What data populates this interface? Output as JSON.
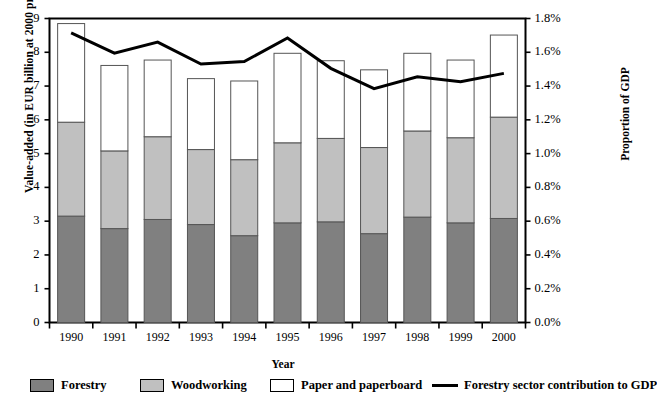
{
  "chart_data": {
    "type": "bar",
    "title": "",
    "subtitle": "",
    "xlabel": "Year",
    "ylabel": "Value-added (in EUR billion at 2000 prices)",
    "y2label": "Proportion of GDP",
    "categories": [
      "1990",
      "1991",
      "1992",
      "1993",
      "1994",
      "1995",
      "1996",
      "1997",
      "1998",
      "1999",
      "2000"
    ],
    "ylim": [
      0,
      9
    ],
    "yticks": [
      "0",
      "1",
      "2",
      "3",
      "4",
      "5",
      "6",
      "7",
      "8",
      "9"
    ],
    "y2lim": [
      0,
      1.8
    ],
    "y2ticks": [
      "0.0%",
      "0.2%",
      "0.4%",
      "0.6%",
      "0.8%",
      "1.0%",
      "1.2%",
      "1.4%",
      "1.6%",
      "1.8%"
    ],
    "grid": false,
    "stacked": true,
    "legend_position": "bottom",
    "series": [
      {
        "name": "Forestry",
        "type": "bar",
        "color": "#808080",
        "values": [
          3.15,
          2.78,
          3.05,
          2.9,
          2.57,
          2.95,
          2.98,
          2.63,
          3.12,
          2.95,
          3.08
        ]
      },
      {
        "name": "Woodworking",
        "type": "bar",
        "color": "#c0c0c0",
        "values": [
          2.78,
          2.3,
          2.45,
          2.22,
          2.25,
          2.37,
          2.47,
          2.55,
          2.55,
          2.52,
          3.0
        ]
      },
      {
        "name": "Paper and paperboard",
        "type": "bar",
        "color": "#ffffff",
        "values": [
          2.92,
          2.53,
          2.27,
          2.1,
          2.33,
          2.65,
          2.3,
          2.3,
          2.3,
          2.3,
          2.43
        ]
      },
      {
        "name": "Forestry sector contribution to GDP",
        "type": "line",
        "axis": "right",
        "color": "#000000",
        "values": [
          1.715,
          1.595,
          1.66,
          1.53,
          1.545,
          1.685,
          1.505,
          1.385,
          1.455,
          1.425,
          1.475
        ]
      }
    ],
    "totals": [
      8.85,
      7.61,
      7.77,
      7.22,
      7.15,
      7.97,
      7.75,
      7.48,
      7.97,
      7.77,
      8.51
    ]
  },
  "legend": {
    "items": [
      {
        "label": "Forestry",
        "marker": "swatch-dark",
        "x": 30
      },
      {
        "label": "Woodworking",
        "marker": "swatch-light",
        "x": 140
      },
      {
        "label": "Paper and paperboard",
        "marker": "swatch-white",
        "x": 270
      },
      {
        "label": "Forestry sector contribution to GDP",
        "marker": "line-black",
        "x": 432
      }
    ]
  }
}
